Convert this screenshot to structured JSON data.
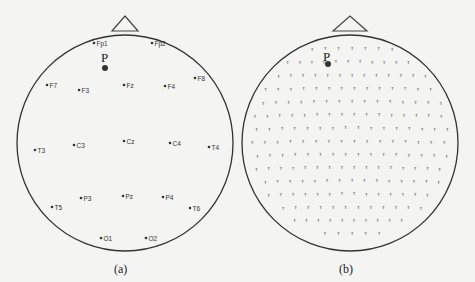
{
  "figure": {
    "panels": [
      {
        "id": "a",
        "caption": "(a)",
        "point_label": "P",
        "description": "10-20 system EEG electrode montage",
        "electrodes": [
          {
            "label": "Fp1",
            "x": 94,
            "y": 43
          },
          {
            "label": "Fp2",
            "x": 152,
            "y": 43
          },
          {
            "label": "F7",
            "x": 47,
            "y": 85
          },
          {
            "label": "F3",
            "x": 79,
            "y": 90
          },
          {
            "label": "Fz",
            "x": 124,
            "y": 85
          },
          {
            "label": "F4",
            "x": 165,
            "y": 86
          },
          {
            "label": "F8",
            "x": 195,
            "y": 78
          },
          {
            "label": "T3",
            "x": 35,
            "y": 150
          },
          {
            "label": "C3",
            "x": 74,
            "y": 145
          },
          {
            "label": "Cz",
            "x": 124,
            "y": 141
          },
          {
            "label": "C4",
            "x": 170,
            "y": 143
          },
          {
            "label": "T4",
            "x": 209,
            "y": 147
          },
          {
            "label": "P3",
            "x": 81,
            "y": 198
          },
          {
            "label": "Pz",
            "x": 123,
            "y": 196
          },
          {
            "label": "P4",
            "x": 163,
            "y": 197
          },
          {
            "label": "T5",
            "x": 52,
            "y": 207
          },
          {
            "label": "T6",
            "x": 190,
            "y": 208
          },
          {
            "label": "O1",
            "x": 101,
            "y": 238
          },
          {
            "label": "O2",
            "x": 146,
            "y": 238
          }
        ]
      },
      {
        "id": "b",
        "caption": "(b)",
        "point_label": "P",
        "description": "High-density EEG electrode montage"
      }
    ]
  }
}
